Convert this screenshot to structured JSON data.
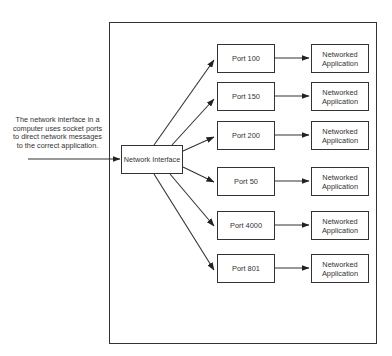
{
  "caption": {
    "lines": [
      "The network interface in a",
      "computer uses socket ports",
      "to direct network messages",
      "to the correct application."
    ]
  },
  "network_interface": {
    "label": "Network Interface"
  },
  "ports": [
    {
      "label": "Port 100",
      "top": 44
    },
    {
      "label": "Port 150",
      "top": 82
    },
    {
      "label": "Port 200",
      "top": 121
    },
    {
      "label": "Port 50",
      "top": 167
    },
    {
      "label": "Port 4000",
      "top": 211
    },
    {
      "label": "Port 801",
      "top": 254
    }
  ],
  "applications": [
    {
      "line1": "Networked",
      "line2": "Application"
    },
    {
      "line1": "Networked",
      "line2": "Application"
    },
    {
      "line1": "Networked",
      "line2": "Application"
    },
    {
      "line1": "Networked",
      "line2": "Application"
    },
    {
      "line1": "Networked",
      "line2": "Application"
    },
    {
      "line1": "Networked",
      "line2": "Application"
    }
  ],
  "colors": {
    "line": "#333333",
    "background": "#ffffff"
  }
}
